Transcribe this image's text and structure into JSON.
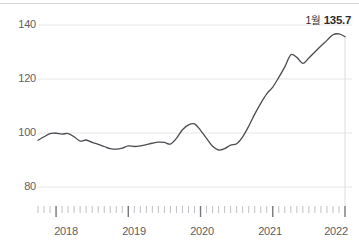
{
  "chart_data": {
    "type": "line",
    "title": "",
    "subtitle": "",
    "xlabel": "",
    "ylabel": "",
    "ylim": [
      70,
      145
    ],
    "xlim": [
      2017.75,
      2022.0
    ],
    "grid": true,
    "legend": false,
    "y_ticks": [
      80,
      100,
      120,
      140
    ],
    "x_ticks": [
      2018,
      2019,
      2020,
      2021,
      2022
    ],
    "x_minor_ticks_per_year": 12,
    "line_color": "#4c4c52",
    "grid_color": "#e6e6e8",
    "axis_text_color": "#5d5d63",
    "annotations": [
      {
        "text": "1월 135.7",
        "month_label": "1월",
        "value_label": "135.7",
        "x": 2022.0,
        "y": 135.7
      }
    ],
    "series": [
      {
        "name": "index",
        "x": [
          2017.75,
          2017.8333,
          2017.9167,
          2018.0,
          2018.0833,
          2018.1667,
          2018.25,
          2018.3333,
          2018.4167,
          2018.5,
          2018.5833,
          2018.6667,
          2018.75,
          2018.8333,
          2018.9167,
          2019.0,
          2019.0833,
          2019.1667,
          2019.25,
          2019.3333,
          2019.4167,
          2019.5,
          2019.5833,
          2019.6667,
          2019.75,
          2019.8333,
          2019.9167,
          2020.0,
          2020.0833,
          2020.1667,
          2020.25,
          2020.3333,
          2020.4167,
          2020.5,
          2020.5833,
          2020.6667,
          2020.75,
          2020.8333,
          2020.9167,
          2021.0,
          2021.0833,
          2021.1667,
          2021.25,
          2021.3333,
          2021.4167,
          2021.5,
          2021.5833,
          2021.6667,
          2021.75,
          2021.8333,
          2021.9167,
          2022.0
        ],
        "values": [
          97.3,
          98.6,
          99.8,
          99.9,
          99.6,
          99.8,
          98.6,
          97.0,
          97.4,
          96.5,
          95.8,
          95.0,
          94.2,
          94.0,
          94.4,
          95.2,
          95.0,
          95.2,
          95.7,
          96.2,
          96.6,
          96.5,
          95.9,
          98.0,
          101.2,
          103.0,
          103.4,
          101.0,
          98.0,
          95.1,
          93.7,
          94.2,
          95.5,
          96.0,
          98.6,
          102.5,
          107.0,
          111.0,
          114.5,
          117.0,
          120.6,
          124.5,
          129.0,
          128.0,
          125.8,
          127.8,
          130.0,
          132.2,
          134.3,
          136.4,
          136.7,
          135.7
        ]
      }
    ]
  },
  "axes": {
    "y_tick_labels": [
      "140",
      "120",
      "100",
      "80"
    ],
    "x_tick_labels": [
      "2018",
      "2019",
      "2020",
      "2021",
      "2022"
    ]
  }
}
